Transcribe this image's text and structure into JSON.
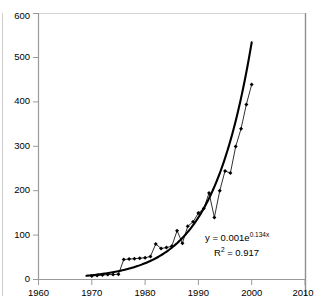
{
  "chart_data": {
    "type": "scatter",
    "title": "",
    "subtitle": "",
    "xlabel": "",
    "ylabel": "",
    "xlim": [
      1960,
      2010
    ],
    "ylim": [
      0,
      600
    ],
    "xticks": [
      1960,
      1970,
      1980,
      1990,
      2000,
      2010
    ],
    "yticks": [
      0,
      100,
      200,
      300,
      400,
      500,
      600
    ],
    "xtick_labels": [
      "1960",
      "1970",
      "1980",
      "1990",
      "2000",
      "2010"
    ],
    "ytick_labels": [
      "0",
      "100",
      "200",
      "300",
      "400",
      "500",
      "600"
    ],
    "grid": false,
    "legend": "none",
    "marker": "diamond",
    "series": [
      {
        "name": "observed",
        "x": [
          1970,
          1971,
          1972,
          1973,
          1974,
          1975,
          1976,
          1977,
          1978,
          1979,
          1980,
          1981,
          1982,
          1983,
          1984,
          1985,
          1986,
          1987,
          1988,
          1989,
          1990,
          1991,
          1992,
          1993,
          1994,
          1995,
          1996,
          1997,
          1998,
          1999,
          2000
        ],
        "values": [
          8,
          9,
          10,
          11,
          11,
          12,
          45,
          46,
          47,
          48,
          49,
          52,
          80,
          70,
          72,
          75,
          110,
          82,
          120,
          130,
          150,
          160,
          195,
          140,
          200,
          245,
          240,
          300,
          340,
          395,
          440
        ]
      }
    ],
    "fit_curve": {
      "name": "exponential trendline",
      "equation_label": "y = 0.001e",
      "equation_exponent": "0.134x",
      "r2_label": "R",
      "r2_superscript": "2",
      "r2_value": " = 0.917",
      "a": 0.001,
      "b": 0.134,
      "x_start": 1969,
      "x_end": 2000,
      "y_end": 535
    },
    "colors": {
      "axis": "#9a9a9a",
      "frame": "#808080",
      "marker": "#000000",
      "series_line": "#1a1a1a",
      "fit_line": "#000000",
      "background": "#ffffff"
    }
  }
}
